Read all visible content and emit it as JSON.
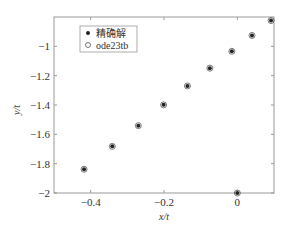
{
  "chart_data": {
    "type": "scatter",
    "title": "",
    "xlabel": "x/t",
    "ylabel": "y/t",
    "xlim": [
      -0.5,
      0.1
    ],
    "ylim": [
      -2,
      -0.8
    ],
    "xticks": [
      -0.4,
      -0.2,
      0
    ],
    "xtick_labels": [
      "−0.4",
      "−0.2",
      "0"
    ],
    "yticks": [
      -1,
      -1.2,
      -1.4,
      -1.6,
      -1.8,
      -2
    ],
    "ytick_labels": [
      "−1",
      "−1.2",
      "−1.4",
      "−1.6",
      "−1.8",
      "−2"
    ],
    "grid": false,
    "legend_position": "upper left",
    "series": [
      {
        "name": "精确解",
        "marker": "filled-dot",
        "x": [
          -0.418,
          -0.341,
          -0.27,
          -0.201,
          -0.136,
          -0.075,
          -0.015,
          0.04,
          0.092,
          0
        ],
        "y": [
          -1.838,
          -1.682,
          -1.541,
          -1.399,
          -1.27,
          -1.149,
          -1.034,
          -0.926,
          -0.824,
          -2
        ]
      },
      {
        "name": "ode23tb",
        "marker": "open-circle",
        "x": [
          -0.418,
          -0.341,
          -0.27,
          -0.201,
          -0.136,
          -0.075,
          -0.015,
          0.04,
          0.092,
          0
        ],
        "y": [
          -1.838,
          -1.682,
          -1.541,
          -1.399,
          -1.27,
          -1.149,
          -1.034,
          -0.926,
          -0.824,
          -2
        ]
      }
    ]
  },
  "legend": {
    "items": [
      {
        "label": "精确解"
      },
      {
        "label": "ode23tb"
      }
    ]
  }
}
